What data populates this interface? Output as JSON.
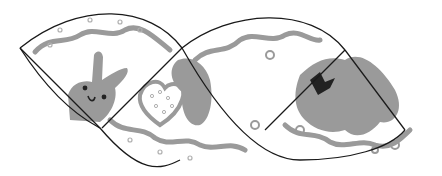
{
  "illustration": {
    "description": "Two lens-shaped egg-wrap craft templates with gray cookie decorations",
    "shapes": [
      {
        "name": "left-lens",
        "motifs": [
          "bunny",
          "heart"
        ]
      },
      {
        "name": "right-lens",
        "motifs": [
          "star",
          "bow"
        ]
      }
    ],
    "colors": {
      "background": "#ffffff",
      "outline": "#1a1a1a",
      "decoration": "#9a9a9a",
      "decoration_light": "#b8b8b8",
      "accent_dark": "#222222"
    }
  }
}
